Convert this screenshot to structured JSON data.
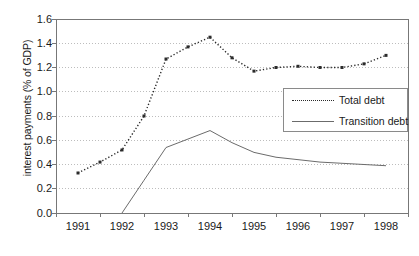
{
  "chart_data": {
    "type": "line",
    "title": "",
    "xlabel": "",
    "ylabel": "interest payments (% of GDP)",
    "categories": [
      "1991",
      "1992",
      "1993",
      "1994",
      "1995",
      "1996",
      "1997",
      "1998"
    ],
    "ylim": [
      0.0,
      1.6
    ],
    "ytick_labels": [
      "0.0",
      "0.2",
      "0.4",
      "0.6",
      "0.8",
      "1.0",
      "1.2",
      "1.4",
      "1.6"
    ],
    "ytick_values": [
      0.0,
      0.2,
      0.4,
      0.6,
      0.8,
      1.0,
      1.2,
      1.4,
      1.6
    ],
    "grid": "horizontal-dotted",
    "legend_position": "center-right",
    "series": [
      {
        "name": "Total debt",
        "style": "dotted",
        "color": "#2b2b2b",
        "x": [
          1991.0,
          1991.5,
          1992.0,
          1992.5,
          1993.0,
          1993.5,
          1994.0,
          1994.5,
          1995.0,
          1995.5,
          1996.0,
          1996.5,
          1997.0,
          1997.5,
          1998.0
        ],
        "values": [
          0.33,
          0.42,
          0.52,
          0.8,
          1.27,
          1.37,
          1.45,
          1.28,
          1.17,
          1.2,
          1.21,
          1.2,
          1.2,
          1.23,
          1.3
        ]
      },
      {
        "name": "Transition debt",
        "style": "solid",
        "color": "#6b6b6b",
        "x": [
          1992.0,
          1992.5,
          1993.0,
          1993.5,
          1994.0,
          1994.5,
          1995.0,
          1995.5,
          1996.0,
          1996.5,
          1997.0,
          1997.5,
          1998.0
        ],
        "values": [
          0.0,
          0.27,
          0.54,
          0.61,
          0.68,
          0.58,
          0.5,
          0.46,
          0.44,
          0.42,
          0.41,
          0.4,
          0.39
        ]
      }
    ]
  },
  "legend": {
    "items": [
      {
        "label": "Total debt"
      },
      {
        "label": "Transition debt"
      }
    ]
  }
}
